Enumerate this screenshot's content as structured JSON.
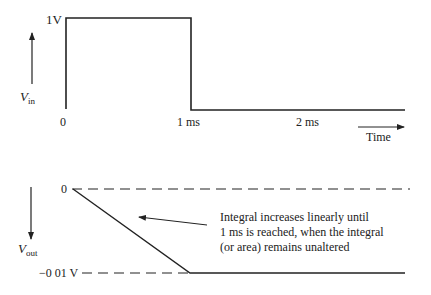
{
  "diagram": {
    "top_graph": {
      "y_axis_label": "V",
      "y_axis_label_sub": "in",
      "y_level_label": "1V",
      "x_tick_labels": [
        "0",
        "1 ms",
        "2 ms"
      ],
      "x_axis_label": "Time",
      "waveform": "square pulse, 1 V from 0 to 1 ms, 0 V afterwards"
    },
    "bottom_graph": {
      "y_axis_label": "V",
      "y_axis_label_sub": "out",
      "y_zero_label": "0",
      "y_level_label": "−0 01 V",
      "waveform": "linear ramp from 0 to -0.01 V over 0-1 ms, then constant",
      "annotation": [
        "Integral increases linearly until",
        "1 ms is reached, when the integral",
        "(or area) remains unaltered"
      ]
    },
    "colors": {
      "line": "#222222",
      "background": "#ffffff"
    }
  }
}
